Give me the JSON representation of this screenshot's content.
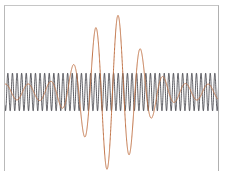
{
  "figure": {
    "title": "",
    "background_color": "#ffffff",
    "frame_color": "#b9b9b9"
  },
  "chart_data": {
    "type": "line",
    "title": "",
    "subtitle": "",
    "xlabel": "",
    "ylabel": "",
    "grid": false,
    "legend_position": "none",
    "axis_ticks_visible": false,
    "xlim": [
      0,
      215
    ],
    "ylim": [
      -48,
      48
    ],
    "baseline_y": 0,
    "series": [
      {
        "name": "fast-wave",
        "label": "High frequency wave (constant amplitude)",
        "color": "#2b2b33",
        "line_width": 0.85,
        "opacity": 0.9,
        "waveform": "sine",
        "amplitude": 10.5,
        "wavelength": 4.6,
        "phase": 0.0,
        "envelope": "constant",
        "x_start": 0,
        "x_end": 215,
        "samples": 3000
      },
      {
        "name": "slow-wave",
        "label": "Low frequency wave (gaussian envelope)",
        "color": "#bf7043",
        "line_width": 1.0,
        "opacity": 1.0,
        "waveform": "sine",
        "amplitude": 44,
        "wavelength": 22.5,
        "phase": 0.0,
        "envelope": "gaussian",
        "envelope_center": 107,
        "envelope_sigma": 34,
        "envelope_floor": 0.1,
        "x_start": 0,
        "x_end": 215,
        "samples": 3000
      }
    ],
    "annotations": []
  }
}
